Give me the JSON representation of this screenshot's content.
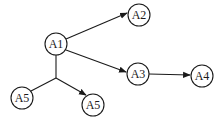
{
  "diagram": {
    "type": "directed-graph",
    "nodes": [
      {
        "id": "n1",
        "label": "A1",
        "x": 56,
        "y": 44
      },
      {
        "id": "n2",
        "label": "A2",
        "x": 139,
        "y": 15
      },
      {
        "id": "n3",
        "label": "A3",
        "x": 138,
        "y": 74
      },
      {
        "id": "n4",
        "label": "A4",
        "x": 202,
        "y": 76
      },
      {
        "id": "n5",
        "label": "A5",
        "x": 22,
        "y": 98
      },
      {
        "id": "n6",
        "label": "A5",
        "x": 93,
        "y": 105
      }
    ],
    "edges": [
      {
        "from": "A1",
        "to": "A2",
        "arrow": true
      },
      {
        "from": "A1",
        "to": "A3",
        "arrow": true
      },
      {
        "from": "A3",
        "to": "A4",
        "arrow": true
      },
      {
        "from": "A1",
        "to": "junction",
        "arrow": false
      },
      {
        "from": "A5 (left)",
        "to": "junction",
        "arrow": false
      },
      {
        "from": "junction",
        "to": "A5 (right)",
        "arrow": true
      }
    ]
  }
}
